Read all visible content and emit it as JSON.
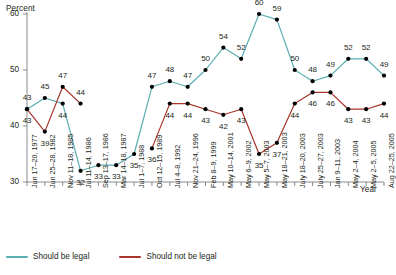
{
  "chart_data": {
    "type": "line",
    "title": "",
    "ylabel": "Percent",
    "xlabel": "Year",
    "ylim": [
      30,
      60
    ],
    "yticks": [
      30,
      40,
      50,
      60
    ],
    "grid": false,
    "legend_position": "bottom-left",
    "categories": [
      "Jun 17–20, 1977",
      "Jun 25–28, 1982",
      "Nov 11–18, 1985",
      "Jul 11–14, 1986",
      "Sep 13–17, 1986",
      "Mar 14–18, 1987",
      "Jul 1–7, 1988",
      "Oct 12–15, 1989",
      "Jul 4–8, 1992",
      "Nov 21–24, 1996",
      "Feb 8–9, 1999",
      "May 10–14, 2001",
      "May 6–9, 2002",
      "May 5–7, 2003",
      "May 18–21, 2003",
      "July 18–20, 2003",
      "July 25–27, 2003",
      "Jan 9–11, 2003",
      "May 2–4, 2004",
      "May 2–5, 2005",
      "Aug 22–25, 2005"
    ],
    "series": [
      {
        "name": "Should be legal",
        "color": "#5aadb0",
        "values": [
          43,
          45,
          44,
          32,
          33,
          33,
          35,
          47,
          48,
          47,
          50,
          54,
          52,
          60,
          59,
          50,
          48,
          49,
          52,
          52,
          49
        ]
      },
      {
        "name": "Should not be legal",
        "color": "#a8342a",
        "values": [
          43,
          39,
          47,
          44,
          null,
          null,
          null,
          36,
          44,
          44,
          43,
          42,
          43,
          35,
          37,
          44,
          46,
          46,
          43,
          43,
          44
        ]
      }
    ]
  },
  "legend": {
    "items": [
      {
        "label": "Should be legal",
        "color": "#5aadb0"
      },
      {
        "label": "Should not be legal",
        "color": "#a8342a"
      }
    ]
  }
}
